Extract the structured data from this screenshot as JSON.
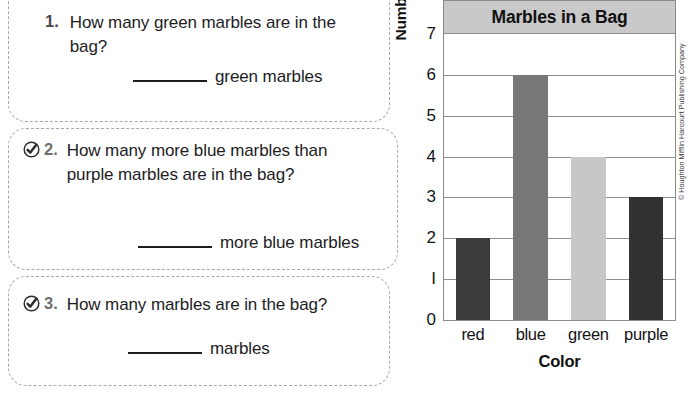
{
  "worksheet": {
    "questions": [
      {
        "number": "1.",
        "has_check_icon": false,
        "icon": "circled-check-icon",
        "text": "How many green marbles are in the bag?",
        "answer_unit": "green marbles"
      },
      {
        "number": "2.",
        "has_check_icon": true,
        "icon": "circled-check-icon",
        "text": "How many more blue marbles than purple marbles are in the bag?",
        "answer_unit": "more blue marbles"
      },
      {
        "number": "3.",
        "has_check_icon": true,
        "icon": "circled-check-icon",
        "text": "How many marbles are in the bag?",
        "answer_unit": "marbles"
      }
    ]
  },
  "chart_data": {
    "type": "bar",
    "title": "Marbles in a Bag",
    "xlabel": "Color",
    "ylabel": "Number of Marbles",
    "categories": [
      "red",
      "blue",
      "green",
      "purple"
    ],
    "values": [
      2,
      6,
      4,
      3
    ],
    "ylim": [
      0,
      7
    ],
    "ytick_labels": [
      "0",
      "I",
      "2",
      "3",
      "4",
      "5",
      "6",
      "7"
    ],
    "ytick_values": [
      0,
      1,
      2,
      3,
      4,
      5,
      6,
      7
    ],
    "grid": true,
    "legend": "none",
    "bar_colors": [
      "#3c3c3c",
      "#787878",
      "#c7c7c7",
      "#323232"
    ]
  },
  "attribution": {
    "text": "© Houghton Mifflin Harcourt Publishing Company"
  },
  "colors": {
    "title_band": "#c9c9c9",
    "frame": "#8a8a8a",
    "dashed_border": "#a8a8ac"
  }
}
